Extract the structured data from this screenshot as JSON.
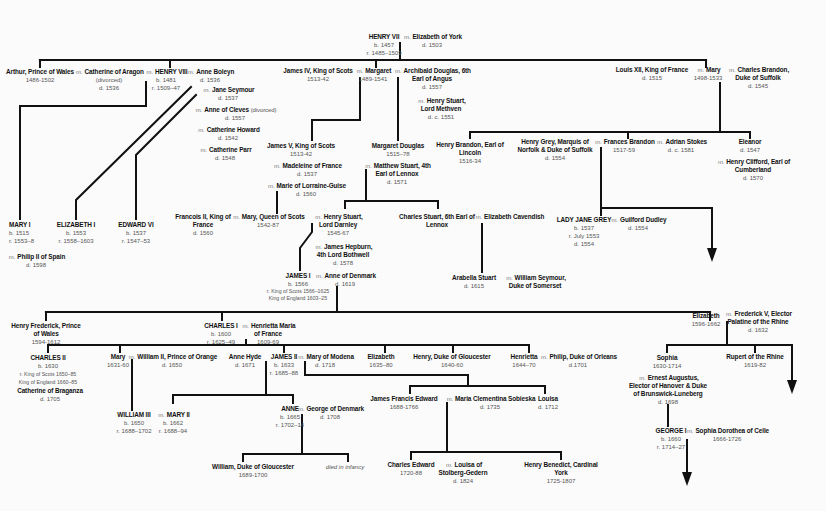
{
  "marriage_symbol": "m.",
  "people": {
    "henry7": {
      "name": "HENRY VII",
      "dates": [
        "b. 1457",
        "r. 1485–1509"
      ]
    },
    "eliz_york": {
      "name": "Elizabeth of York",
      "dates": [
        "d. 1503"
      ]
    },
    "arthur": {
      "name": "Arthur, Prince of Wales",
      "dates": [
        "1486-1502"
      ]
    },
    "cath_aragon": {
      "name": "Catherine of Aragon",
      "dates": [
        "(divorced)",
        "d. 1536"
      ]
    },
    "henry8": {
      "name": "HENRY VIII",
      "dates": [
        "b. 1481",
        "r. 1509–47"
      ]
    },
    "anne_boleyn": {
      "name": "Anne Boleyn",
      "dates": [
        "d. 1536"
      ]
    },
    "jane_seymour": {
      "name": "Jane Seymour",
      "dates": [
        "d. 1537"
      ]
    },
    "anne_cleves": {
      "name": "Anne of Cleves",
      "note": "(divorced)",
      "dates": [
        "d. 1557"
      ]
    },
    "cath_howard": {
      "name": "Catherine Howard",
      "dates": [
        "d. 1542"
      ]
    },
    "cath_parr": {
      "name": "Catherine Parr",
      "dates": [
        "d. 1548"
      ]
    },
    "james4": {
      "name": "James IV, King of Scots",
      "dates": [
        "1513-42"
      ]
    },
    "margaret": {
      "name": "Margaret",
      "dates": [
        "1489-1541"
      ]
    },
    "archibald": {
      "name": "Archibald Douglas, 6th Earl of Angus",
      "dates": [
        "d. 1557"
      ]
    },
    "henry_stuart_methven": {
      "name": "Henry Stuart, Lord Methven",
      "dates": [
        "d. c. 1551"
      ]
    },
    "louis12": {
      "name": "Louis XII, King of France",
      "dates": [
        "d. 1515"
      ]
    },
    "mary_tudor": {
      "name": "Mary",
      "dates": [
        "1498-1533"
      ]
    },
    "charles_brandon": {
      "name": "Charles Brandon, Duke of Suffolk",
      "dates": [
        "d. 1545"
      ]
    },
    "mary1": {
      "name": "MARY I",
      "dates": [
        "b. 1515",
        "r. 1553–8"
      ]
    },
    "philip2": {
      "name": "Philip II of Spain",
      "dates": [
        "d. 1598"
      ]
    },
    "eliz1": {
      "name": "ELIZABETH I",
      "dates": [
        "b. 1553",
        "r. 1558–1603"
      ]
    },
    "edward6": {
      "name": "EDWARD VI",
      "dates": [
        "b. 1537",
        "r. 1547–53"
      ]
    },
    "james5": {
      "name": "James V, King of Scots",
      "dates": [
        "1513-42"
      ]
    },
    "madeleine": {
      "name": "Madeleine of France",
      "dates": [
        "d. 1537"
      ]
    },
    "marie_guise": {
      "name": "Marie of Lorraine-Guise",
      "dates": [
        "d. 1560"
      ]
    },
    "margaret_douglas": {
      "name": "Margaret Douglas",
      "dates": [
        "1515–78"
      ]
    },
    "matthew_stuart": {
      "name": "Matthew Stuart, 4th Earl of Lennox",
      "dates": [
        "d. 1571"
      ]
    },
    "henry_brandon": {
      "name": "Henry Brandon, Earl of Lincoln",
      "dates": [
        "1516-34"
      ]
    },
    "henry_grey": {
      "name": "Henry Grey, Marquis of Norfolk & Duke of Suffolk",
      "dates": [
        "d. 1554"
      ]
    },
    "frances_brandon": {
      "name": "Frances Brandon",
      "dates": [
        "1517-59"
      ]
    },
    "adrian_stokes": {
      "name": "Adrian Stokes",
      "dates": [
        "d. c. 1581"
      ]
    },
    "eleanor": {
      "name": "Eleanor",
      "dates": [
        "d. 1547"
      ]
    },
    "henry_clifford": {
      "name": "Henry Clifford, Earl of Cumberland",
      "dates": [
        "d. 1570"
      ]
    },
    "francois2": {
      "name": "Francois II, King of France",
      "dates": [
        "d. 1560"
      ]
    },
    "mary_qos": {
      "name": "Mary, Queen of Scots",
      "dates": [
        "1542-87"
      ]
    },
    "darnley": {
      "name": "Henry Stuart, Lord Darnley",
      "dates": [
        "1545-67"
      ]
    },
    "bothwell": {
      "name": "James Hepburn, 4th Lord Bothwell",
      "dates": [
        "d. 1578"
      ]
    },
    "charles_stuart_lennox": {
      "name": "Charles Stuart, 6th Earl of Lennox",
      "dates": []
    },
    "eliz_cavendish": {
      "name": "Elizabeth Cavendish",
      "dates": []
    },
    "lady_jane_grey": {
      "name": "LADY JANE GREY",
      "dates": [
        "b. 1537",
        "r. July 1553",
        "d. 1554"
      ]
    },
    "guilford": {
      "name": "Guilford Dudley",
      "dates": [
        "d. 1554"
      ]
    },
    "arabella": {
      "name": "Arabella Stuart",
      "dates": [
        "d. 1615"
      ]
    },
    "william_seymour": {
      "name": "William Seymour, Duke of Somerset",
      "dates": []
    },
    "james1": {
      "name": "JAMES I",
      "dates": [
        "b. 1566",
        "r. King of Scots 1566–1625",
        "King of England 1603–25"
      ]
    },
    "anne_denmark": {
      "name": "Anne of Denmark",
      "dates": [
        "d. 1619"
      ]
    },
    "henry_frederick": {
      "name": "Henry Frederick, Prince of Wales",
      "dates": [
        "1594-1612"
      ]
    },
    "charles1": {
      "name": "CHARLES I",
      "dates": [
        "b. 1600",
        "r. 1625–49"
      ]
    },
    "henrietta_maria": {
      "name": "Henrietta Maria of France",
      "dates": [
        "1609-69"
      ]
    },
    "eliz_bohemia": {
      "name": "Elizabeth",
      "dates": [
        "1596-1662"
      ]
    },
    "frederick5": {
      "name": "Frederick V, Elector Palatine of the Rhine",
      "dates": [
        "d. 1632"
      ]
    },
    "charles2": {
      "name": "CHARLES II",
      "dates": [
        "b. 1630",
        "r. King of Scots 1650–85",
        "King of England 1660–85"
      ]
    },
    "cath_braganza": {
      "name": "Catherine of Braganza",
      "dates": [
        "d. 1705"
      ]
    },
    "mary_orange": {
      "name": "Mary",
      "dates": [
        "1631-60"
      ]
    },
    "william2_orange": {
      "name": "William II, Prince of Orange",
      "dates": [
        "d. 1650"
      ]
    },
    "anne_hyde": {
      "name": "Anne Hyde",
      "dates": [
        "d. 1671"
      ]
    },
    "james2": {
      "name": "JAMES II",
      "dates": [
        "b. 1633",
        "r. 1685–88"
      ]
    },
    "mary_modena": {
      "name": "Mary of Modena",
      "dates": [
        "d. 1718"
      ]
    },
    "elizabeth_c1": {
      "name": "Elizabeth",
      "dates": [
        "1635–80"
      ]
    },
    "henry_gloucester": {
      "name": "Henry, Duke of Gloucester",
      "dates": [
        "1640-60"
      ]
    },
    "henrietta": {
      "name": "Henrietta",
      "dates": [
        "1644–70"
      ]
    },
    "philip_orleans": {
      "name": "Philip, Duke of Orleans",
      "dates": [
        "d.1701"
      ]
    },
    "sophia": {
      "name": "Sophia",
      "dates": [
        "1630-1714"
      ]
    },
    "ernest_augustus": {
      "name": "Ernest Augustus, Elector of Hanover & Duke of Brunswick-Luneberg",
      "dates": [
        "d. 1698"
      ]
    },
    "rupert": {
      "name": "Rupert of the Rhine",
      "dates": [
        "1619-82"
      ]
    },
    "william3": {
      "name": "WILLIAM III",
      "dates": [
        "b. 1650",
        "r. 1688–1702"
      ]
    },
    "mary2": {
      "name": "MARY II",
      "dates": [
        "b. 1662",
        "r. 1688–94"
      ]
    },
    "anne": {
      "name": "ANNE",
      "dates": [
        "b. 1665",
        "r. 1702–14"
      ]
    },
    "george_denmark": {
      "name": "George of Denmark",
      "dates": [
        "d. 1708"
      ]
    },
    "james_francis": {
      "name": "James Francis Edward",
      "dates": [
        "1688-1766"
      ]
    },
    "maria_sobieska": {
      "name": "Maria Clementina Sobieska",
      "dates": [
        "d. 1735"
      ]
    },
    "louisa": {
      "name": "Louisa",
      "dates": [
        "d. 1712"
      ]
    },
    "william_gloucester": {
      "name": "William, Duke of Gloucester",
      "dates": [
        "1689-1700"
      ]
    },
    "died_infancy": {
      "name": "died in infancy"
    },
    "charles_edward": {
      "name": "Charles Edward",
      "dates": [
        "1720-88"
      ]
    },
    "louisa_stolberg": {
      "name": "Louisa of Stolberg-Gedern",
      "dates": [
        "d. 1824"
      ]
    },
    "henry_benedict": {
      "name": "Henry Benedict, Cardinal York",
      "dates": [
        "1725-1807"
      ]
    },
    "george1": {
      "name": "GEORGE I",
      "dates": [
        "b. 1660",
        "r. 1714–27"
      ]
    },
    "sophia_dorothea": {
      "name": "Sophia Dorothea of Celle",
      "dates": [
        "1666-1726"
      ]
    }
  }
}
